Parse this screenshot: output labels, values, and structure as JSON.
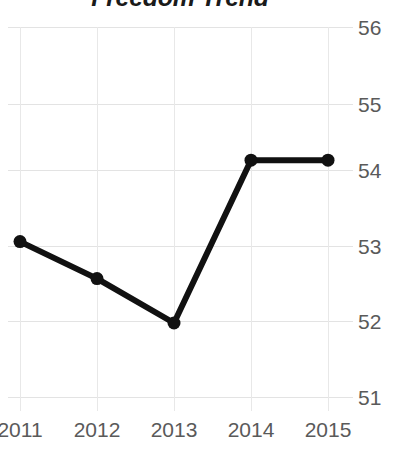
{
  "chart_data": {
    "type": "line",
    "title": "Freedom Trend",
    "xlabel": "",
    "ylabel": "",
    "categories": [
      "2011",
      "2012",
      "2013",
      "2014",
      "2015"
    ],
    "x": [
      2011,
      2012,
      2013,
      2014,
      2015
    ],
    "values": [
      53.1,
      52.6,
      52.0,
      54.2,
      54.2
    ],
    "series": [
      {
        "name": "Freedom Trend",
        "values": [
          53.1,
          52.6,
          52.0,
          54.2,
          54.2
        ]
      }
    ],
    "yticks": [
      56,
      55,
      54,
      53,
      52,
      51
    ],
    "ytick_labels": [
      "56",
      "55",
      "54",
      "53",
      "52",
      "51"
    ],
    "xtick_labels": [
      "2011",
      "2012",
      "2013",
      "2014",
      "2015"
    ],
    "ylim": [
      50.7,
      56.2
    ],
    "xlim": [
      2011,
      2015
    ],
    "grid": true,
    "grid_axis": "both",
    "legend": false,
    "legend_position": "none",
    "y_axis_side": "right",
    "marker": "circle",
    "line_color": "#111111",
    "marker_color": "#111111",
    "grid_color": "#e3e3e3",
    "tick_label_color": "#5a5a5a",
    "title_color": "#1a1a1a"
  }
}
